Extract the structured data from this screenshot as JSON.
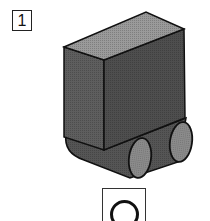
{
  "question": {
    "number": "1",
    "answer_symbol": "○"
  },
  "figure": {
    "colors": {
      "top_face": "#9a9a9a",
      "left_face": "#5e5e5e",
      "right_face": "#4e4e4e",
      "belt": "#555555",
      "wheel_face": "#8c8c8c",
      "outline": "#111111"
    }
  }
}
